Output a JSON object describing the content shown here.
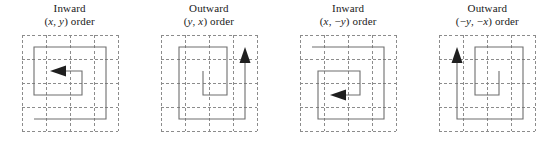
{
  "figure": {
    "panel_count": 4,
    "grid": {
      "rows": 4,
      "cols": 4,
      "dash_color": "#8c8c8c",
      "path_color": "#6e6e6e",
      "arrow_color": "#1f1f1f",
      "background": "#ffffff"
    }
  },
  "panels": [
    {
      "id": "panel-inward-xy",
      "caption_line1": "Inward",
      "caption_line2_prefix": "(",
      "caption_line2_var1": "x",
      "caption_line2_sep": ", ",
      "caption_line2_var2": "y",
      "caption_line2_suffix": ") order",
      "caption_full": "Inward (x, y) order",
      "direction": "inward",
      "order": "(x, y)",
      "arrow_direction": "left",
      "arrow_position": "center"
    },
    {
      "id": "panel-outward-yx",
      "caption_line1": "Outward",
      "caption_line2_prefix": "(",
      "caption_line2_var1": "y",
      "caption_line2_sep": ", ",
      "caption_line2_var2": "x",
      "caption_line2_suffix": ") order",
      "caption_full": "Outward (y, x) order",
      "direction": "outward",
      "order": "(y, x)",
      "arrow_direction": "up",
      "arrow_position": "right-edge"
    },
    {
      "id": "panel-inward-x-negy",
      "caption_line1": "Inward",
      "caption_line2_prefix": "(",
      "caption_line2_var1": "x",
      "caption_line2_sep": ", −",
      "caption_line2_var2": "y",
      "caption_line2_suffix": ") order",
      "caption_full": "Inward (x, −y) order",
      "direction": "inward",
      "order": "(x, −y)",
      "arrow_direction": "left",
      "arrow_position": "center"
    },
    {
      "id": "panel-outward-negy-negx",
      "caption_line1": "Outward",
      "caption_line2_prefix": "(−",
      "caption_line2_var1": "y",
      "caption_line2_sep": ", −",
      "caption_line2_var2": "x",
      "caption_line2_suffix": ") order",
      "caption_full": "Outward (−y, −x) order",
      "direction": "outward",
      "order": "(−y, −x)",
      "arrow_direction": "up",
      "arrow_position": "left-edge"
    }
  ]
}
